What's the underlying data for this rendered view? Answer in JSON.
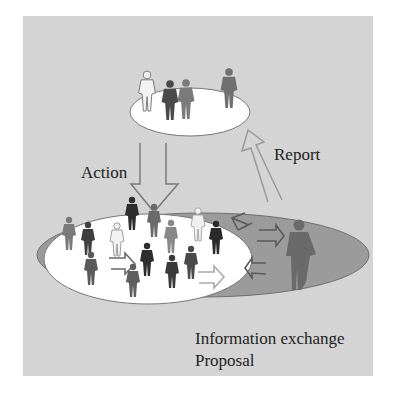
{
  "diagram": {
    "labels": {
      "action": "Action",
      "report": "Report",
      "info_exchange": "Information exchange",
      "proposal": "Proposal"
    },
    "colors": {
      "background": "#d4d4d4",
      "ellipse_fill": "#ffffff",
      "outer_ellipse": "#9b9b9b",
      "arrow_stroke": "#8a8a8a"
    }
  }
}
